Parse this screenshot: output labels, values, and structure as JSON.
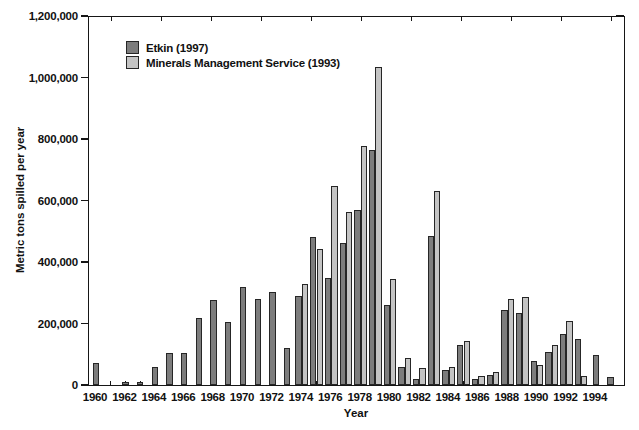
{
  "chart_data": {
    "type": "bar",
    "title": "",
    "xlabel": "Year",
    "ylabel": "Metric tons spilled per year",
    "ylim": [
      0,
      1200000
    ],
    "grid": false,
    "legend_position": "top-left-inside",
    "yticks": [
      {
        "value": 0,
        "label": "0"
      },
      {
        "value": 200000,
        "label": "200,000"
      },
      {
        "value": 400000,
        "label": "400,000"
      },
      {
        "value": 600000,
        "label": "600,000"
      },
      {
        "value": 800000,
        "label": "800,000"
      },
      {
        "value": 1000000,
        "label": "1,000,000"
      },
      {
        "value": 1200000,
        "label": "1,200,000"
      }
    ],
    "xtick_labels": [
      "1960",
      "1962",
      "1964",
      "1966",
      "1968",
      "1970",
      "1972",
      "1974",
      "1976",
      "1978",
      "1980",
      "1982",
      "1984",
      "1986",
      "1988",
      "1990",
      "1992",
      "1994"
    ],
    "categories": [
      1960,
      1961,
      1962,
      1963,
      1964,
      1965,
      1966,
      1967,
      1968,
      1969,
      1970,
      1971,
      1972,
      1973,
      1974,
      1975,
      1976,
      1977,
      1978,
      1979,
      1980,
      1981,
      1982,
      1983,
      1984,
      1985,
      1986,
      1987,
      1988,
      1989,
      1990,
      1991,
      1992,
      1993,
      1994,
      1995
    ],
    "series": [
      {
        "name": "Etkin (1997)",
        "color": "#7d7d7d",
        "values": [
          72000,
          0,
          10000,
          9000,
          60000,
          105000,
          105000,
          218000,
          277000,
          204000,
          320000,
          280000,
          302000,
          121000,
          289000,
          482000,
          348000,
          462000,
          569000,
          764000,
          260000,
          58000,
          21000,
          485000,
          50000,
          130000,
          20000,
          33000,
          245000,
          234000,
          77000,
          107000,
          167000,
          148000,
          98000,
          27000
        ]
      },
      {
        "name": "Minerals Management Service (1993)",
        "color": "#c4c4c4",
        "values": [
          null,
          null,
          null,
          null,
          null,
          null,
          null,
          null,
          null,
          null,
          null,
          null,
          null,
          null,
          327000,
          442000,
          646000,
          563000,
          777000,
          1035000,
          346000,
          88000,
          55000,
          632000,
          60000,
          144000,
          30000,
          42000,
          281000,
          287000,
          66000,
          129000,
          209000,
          30000,
          null,
          null
        ]
      }
    ]
  }
}
